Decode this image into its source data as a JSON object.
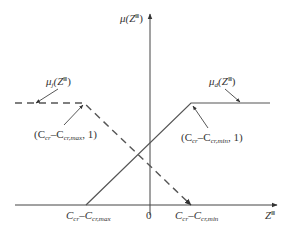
{
  "diagram": {
    "type": "fuzzy-membership-functions",
    "y_axis": {
      "label_base": "μ(Z",
      "label_sup": "Ⅲ",
      "label_close": ")"
    },
    "x_axis": {
      "label_base": "Z",
      "label_sup": "Ⅲ",
      "origin_label": "0"
    },
    "x_ticks": [
      {
        "id": "cmax",
        "text_a": "C",
        "sub_a": "cr",
        "dash": "–",
        "text_b": "C",
        "sub_b": "cr,max"
      },
      {
        "id": "cmin",
        "text_a": "C",
        "sub_a": "cr",
        "dash": "–",
        "text_b": "C",
        "sub_b": "cr,min"
      }
    ],
    "curves": [
      {
        "name": "μ_j",
        "label_base": "μ",
        "label_sub": "j",
        "label_arg": "(Z",
        "label_sup": "Ⅲ",
        "label_close": ")",
        "style": "dashed"
      },
      {
        "name": "μ_d",
        "label_base": "μ",
        "label_sub": "d",
        "label_arg": "(Z",
        "label_sup": "Ⅲ",
        "label_close": ")",
        "style": "solid"
      }
    ],
    "points": [
      {
        "open": "(C",
        "sub_a": "cr",
        "dash": "–C",
        "sub_b": "cr,max",
        "close": ", 1)"
      },
      {
        "open": "(C",
        "sub_a": "cr",
        "dash": "–C",
        "sub_b": "cr,min",
        "close": ", 1)"
      }
    ],
    "colors": {
      "line": "#444444",
      "text": "#333333",
      "background": "#ffffff"
    }
  }
}
